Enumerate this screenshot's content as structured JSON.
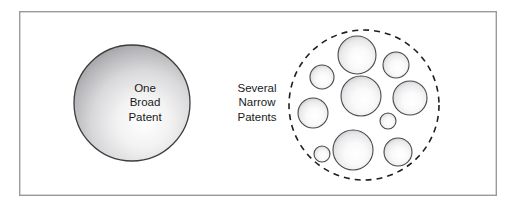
{
  "figure": {
    "background_color": "#ffffff",
    "frame": {
      "name": "outer-frame",
      "x": 19,
      "y": 11,
      "width": 478,
      "height": 185,
      "stroke_color": "#9a9a9d",
      "fill_color": "#ffffff",
      "stroke_width": 1.4
    }
  },
  "left_concept": {
    "name": "one-broad-patent",
    "label_lines": [
      "One",
      "Broad",
      "Patent"
    ],
    "label_line_1": "One",
    "label_line_2": "Broad",
    "label_line_3": "Patent",
    "circle": {
      "cx": 132,
      "cy": 103,
      "r": 58,
      "stroke_color": "#3d3d3d",
      "fill_light": "#fcfcfc",
      "fill_dark": "#9d9da0",
      "stroke_width": 1.3
    },
    "label_color": "#1a1a1a",
    "label_x": 145,
    "label_y": 103,
    "label_line_height": 14.5
  },
  "right_concept": {
    "name": "several-narrow-patents",
    "label_lines": [
      "Several",
      "Narrow",
      "Patents"
    ],
    "label_line_1": "Several",
    "label_line_2": "Narrow",
    "label_line_3": "Patents",
    "label_color": "#1a1a1a",
    "label_x": 257,
    "label_y": 103,
    "label_line_height": 14.5,
    "dashed_circle": {
      "cx": 364,
      "cy": 105,
      "r": 75,
      "stroke_color": "#1f1f1f",
      "stroke_width": 1.6,
      "dash_pattern": "6,5",
      "fill_color": "none"
    },
    "inner_circles": [
      {
        "id": "narrow-patent-1",
        "cx": 357,
        "cy": 55,
        "r": 19
      },
      {
        "id": "narrow-patent-2",
        "cx": 322,
        "cy": 77,
        "r": 12
      },
      {
        "id": "narrow-patent-3",
        "cx": 396,
        "cy": 65,
        "r": 13
      },
      {
        "id": "narrow-patent-4",
        "cx": 361,
        "cy": 96,
        "r": 20
      },
      {
        "id": "narrow-patent-5",
        "cx": 410,
        "cy": 98,
        "r": 17
      },
      {
        "id": "narrow-patent-6",
        "cx": 313,
        "cy": 113,
        "r": 15
      },
      {
        "id": "narrow-patent-7",
        "cx": 388,
        "cy": 121,
        "r": 8
      },
      {
        "id": "narrow-patent-8",
        "cx": 353,
        "cy": 150,
        "r": 20
      },
      {
        "id": "narrow-patent-9",
        "cx": 398,
        "cy": 152,
        "r": 14
      },
      {
        "id": "narrow-patent-10",
        "cx": 322,
        "cy": 154,
        "r": 8
      }
    ],
    "inner_circle_count": 10,
    "inner_circle_style": {
      "stroke_color": "#4a4a4a",
      "fill_light": "#fdfdfd",
      "fill_dark": "#b4b4b7",
      "stroke_width": 1.1
    }
  }
}
